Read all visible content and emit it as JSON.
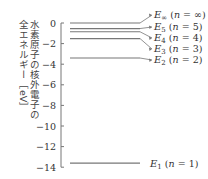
{
  "ylabel": {
    "line1": "水素原子の核外電子の",
    "line2": "全エネルギー［eV］"
  },
  "axis": {
    "ticks": [
      "0",
      "−2",
      "−4",
      "−6",
      "−8",
      "−10",
      "−12",
      "−14"
    ],
    "values": [
      0,
      -2,
      -4,
      -6,
      -8,
      -10,
      -12,
      -14
    ]
  },
  "levels": [
    {
      "label": "E∞ (n = ∞)",
      "sym": "E",
      "sub": "∞",
      "n": "∞",
      "energy": 0
    },
    {
      "label": "E5 (n = 5)",
      "sym": "E",
      "sub": "5",
      "n": "5",
      "energy": -0.54
    },
    {
      "label": "E4 (n = 4)",
      "sym": "E",
      "sub": "4",
      "n": "4",
      "energy": -0.85
    },
    {
      "label": "E3 (n = 3)",
      "sym": "E",
      "sub": "3",
      "n": "3",
      "energy": -1.51
    },
    {
      "label": "E2 (n = 2)",
      "sym": "E",
      "sub": "2",
      "n": "2",
      "energy": -3.4
    },
    {
      "label": "E1 (n = 1)",
      "sym": "E",
      "sub": "1",
      "n": "1",
      "energy": -13.6
    }
  ],
  "colors": {
    "line": "#777777",
    "text": "#333333"
  }
}
